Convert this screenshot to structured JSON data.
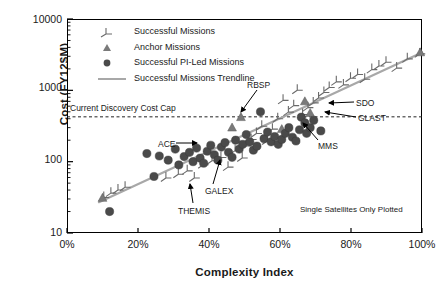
{
  "chart_data": {
    "type": "scatter",
    "title": "",
    "xlabel": "Complexity Index",
    "ylabel": "Cost (FY12$M)",
    "xlim": [
      0,
      100
    ],
    "ylim": [
      10,
      10000
    ],
    "yscale": "log",
    "grid": false,
    "legend_position": "upper-left",
    "xticks": [
      "0%",
      "20%",
      "40%",
      "60%",
      "80%",
      "100%"
    ],
    "xtick_values": [
      0,
      20,
      40,
      60,
      80,
      100
    ],
    "yticks": [
      "10",
      "100",
      "1000",
      "10000"
    ],
    "ytick_values": [
      10,
      100,
      1000,
      10000
    ],
    "note": "Single Satellites Only Plotted",
    "cost_cap": {
      "label": "Current Discovery Cost Cap",
      "value": 425,
      "style": "dashed"
    },
    "legend": [
      {
        "label": "Successful Missions",
        "marker": "hook"
      },
      {
        "label": "Anchor Missions",
        "marker": "triangle"
      },
      {
        "label": "Successful PI-Led Missions",
        "marker": "circle"
      },
      {
        "label": "Successful Missions Trendline",
        "marker": "line"
      }
    ],
    "series": [
      {
        "name": "Successful Missions",
        "marker": "hook",
        "color": "#4d4d4d",
        "points": [
          [
            10.5,
            33
          ],
          [
            12.5,
            38
          ],
          [
            14.5,
            42
          ],
          [
            16.5,
            46
          ],
          [
            28.0,
            62
          ],
          [
            31.5,
            70
          ],
          [
            34.0,
            78
          ],
          [
            36.0,
            62
          ],
          [
            38.5,
            95
          ],
          [
            41.0,
            108
          ],
          [
            43.5,
            120
          ],
          [
            45.5,
            88
          ],
          [
            47.5,
            150
          ],
          [
            49.5,
            118
          ],
          [
            50.5,
            175
          ],
          [
            52.0,
            215
          ],
          [
            53.5,
            260
          ],
          [
            55.0,
            330
          ],
          [
            56.5,
            205
          ],
          [
            58.0,
            300
          ],
          [
            59.5,
            420
          ],
          [
            61.0,
            760
          ],
          [
            62.5,
            520
          ],
          [
            64.0,
            640
          ],
          [
            65.0,
            1050
          ],
          [
            66.5,
            480
          ],
          [
            68.0,
            600
          ],
          [
            69.5,
            700
          ],
          [
            71.0,
            820
          ],
          [
            72.5,
            980
          ],
          [
            74.0,
            1150
          ],
          [
            76.0,
            1380
          ],
          [
            78.0,
            1250
          ],
          [
            80.0,
            1550
          ],
          [
            82.0,
            1750
          ],
          [
            84.0,
            1500
          ],
          [
            86.0,
            2050
          ],
          [
            88.0,
            2300
          ],
          [
            90.0,
            2600
          ],
          [
            93.0,
            2150
          ],
          [
            96.0,
            2900
          ],
          [
            99.5,
            3400
          ]
        ]
      },
      {
        "name": "Anchor Missions",
        "marker": "triangle",
        "color": "#7a7a7a",
        "points": [
          [
            10.0,
            31
          ],
          [
            46.5,
            300
          ],
          [
            49.0,
            420
          ],
          [
            60.5,
            285
          ],
          [
            67.0,
            700
          ],
          [
            68.5,
            480
          ],
          [
            99.5,
            3400
          ]
        ]
      },
      {
        "name": "Successful PI-Led Missions",
        "marker": "circle",
        "color": "#4a4a4a",
        "points": [
          [
            12.0,
            20
          ],
          [
            22.5,
            130
          ],
          [
            24.5,
            62
          ],
          [
            26.0,
            120
          ],
          [
            28.5,
            105
          ],
          [
            30.5,
            150
          ],
          [
            31.5,
            90
          ],
          [
            33.0,
            118
          ],
          [
            34.5,
            135
          ],
          [
            35.5,
            100
          ],
          [
            36.5,
            155
          ],
          [
            37.5,
            112
          ],
          [
            38.5,
            95
          ],
          [
            39.5,
            140
          ],
          [
            40.5,
            170
          ],
          [
            41.5,
            125
          ],
          [
            42.5,
            105
          ],
          [
            43.5,
            160
          ],
          [
            44.5,
            185
          ],
          [
            45.5,
            135
          ],
          [
            46.5,
            115
          ],
          [
            47.5,
            200
          ],
          [
            48.5,
            150
          ],
          [
            49.5,
            175
          ],
          [
            50.5,
            240
          ],
          [
            51.5,
            190
          ],
          [
            52.5,
            145
          ],
          [
            53.5,
            165
          ],
          [
            54.5,
            500
          ],
          [
            55.5,
            210
          ],
          [
            56.5,
            260
          ],
          [
            57.5,
            190
          ],
          [
            58.5,
            225
          ],
          [
            59.5,
            175
          ],
          [
            60.5,
            205
          ],
          [
            61.5,
            250
          ],
          [
            62.5,
            300
          ],
          [
            63.5,
            220
          ],
          [
            64.5,
            195
          ],
          [
            65.5,
            280
          ],
          [
            66.0,
            420
          ],
          [
            67.0,
            350
          ],
          [
            67.5,
            250
          ],
          [
            68.5,
            300
          ],
          [
            69.5,
            380
          ],
          [
            71.5,
            270
          ]
        ]
      }
    ],
    "trendline": {
      "name": "Successful Missions Trendline",
      "color": "#a8a8a8",
      "start": [
        9.0,
        27
      ],
      "end": [
        100.0,
        3400
      ]
    },
    "annotations": [
      {
        "label": "RBSP",
        "text_x": 247,
        "text_y": 80,
        "arrow_from": [
          257,
          90
        ],
        "arrow_to": [
          241,
          112
        ]
      },
      {
        "label": "SDO",
        "text_x": 356,
        "text_y": 98,
        "arrow_from": [
          354,
          102
        ],
        "arrow_to": [
          329,
          103
        ]
      },
      {
        "label": "GLAST",
        "text_x": 358,
        "text_y": 113,
        "arrow_from": [
          356,
          117
        ],
        "arrow_to": [
          325,
          112
        ]
      },
      {
        "label": "MMS",
        "text_x": 318,
        "text_y": 141,
        "arrow_from": [
          318,
          140
        ],
        "arrow_to": [
          303,
          123
        ]
      },
      {
        "label": "ACE",
        "text_x": 158,
        "text_y": 139,
        "arrow_from": [
          176,
          143
        ],
        "arrow_to": [
          197,
          143
        ]
      },
      {
        "label": "GALEX",
        "text_x": 205,
        "text_y": 186,
        "arrow_from": [
          213,
          184
        ],
        "arrow_to": [
          220,
          160
        ]
      },
      {
        "label": "THEMIS",
        "text_x": 178,
        "text_y": 206,
        "arrow_from": [
          193,
          203
        ],
        "arrow_to": [
          190,
          184
        ]
      }
    ]
  }
}
